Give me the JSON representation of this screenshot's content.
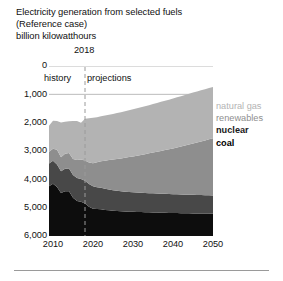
{
  "titles": {
    "line1": "Electricity generation from selected fuels",
    "line2": "(Reference case)",
    "line3": "billion kilowatthours"
  },
  "annotations": {
    "divider_year": "2018",
    "history": "history",
    "projections": "projections"
  },
  "legend": {
    "natural_gas": "natural gas",
    "renewables": "renewables",
    "nuclear": "nuclear",
    "coal": "coal"
  },
  "axes": {
    "y_ticks": [
      "6,000",
      "5,000",
      "4,000",
      "3,000",
      "2,000",
      "1,000",
      "0"
    ],
    "x_ticks": [
      "2010",
      "2020",
      "2030",
      "2040",
      "2050"
    ]
  },
  "colors": {
    "natural_gas": "#b3b3b3",
    "renewables": "#8e8e8e",
    "nuclear": "#484848",
    "coal": "#0d0d0d",
    "gridline": "#a8a8a8",
    "divider": "#9a9a9a",
    "background": "#ffffff"
  },
  "chart_data": {
    "type": "area",
    "stacked": true,
    "title": "Electricity generation from selected fuels (Reference case)",
    "subtitle": "billion kilowatthours",
    "xlabel": "",
    "ylabel": "billion kilowatthours",
    "ylim": [
      0,
      6000
    ],
    "xlim": [
      2009,
      2050
    ],
    "y_ticks": [
      0,
      1000,
      2000,
      3000,
      4000,
      5000,
      6000
    ],
    "x_ticks": [
      2010,
      2020,
      2030,
      2040,
      2050
    ],
    "grid": "horizontal-partial",
    "legend_position": "right",
    "divider_year": 2018,
    "divider_label_left": "history",
    "divider_label_right": "projections",
    "x": [
      2009,
      2010,
      2011,
      2012,
      2013,
      2014,
      2015,
      2016,
      2017,
      2018,
      2019,
      2020,
      2021,
      2022,
      2023,
      2024,
      2025,
      2026,
      2027,
      2028,
      2029,
      2030,
      2031,
      2032,
      2033,
      2034,
      2035,
      2036,
      2037,
      2038,
      2039,
      2040,
      2041,
      2042,
      2043,
      2044,
      2045,
      2046,
      2047,
      2048,
      2049,
      2050
    ],
    "series": [
      {
        "name": "coal",
        "color": "#0d0d0d",
        "values": [
          1756,
          1847,
          1733,
          1514,
          1581,
          1582,
          1352,
          1239,
          1206,
          1146,
          1030,
          966,
          950,
          942,
          920,
          905,
          890,
          880,
          872,
          866,
          860,
          855,
          850,
          845,
          840,
          836,
          832,
          828,
          824,
          820,
          816,
          812,
          808,
          805,
          802,
          800,
          798,
          796,
          794,
          792,
          790,
          788
        ]
      },
      {
        "name": "nuclear",
        "color": "#484848",
        "values": [
          799,
          807,
          790,
          769,
          789,
          797,
          797,
          806,
          805,
          807,
          805,
          790,
          775,
          760,
          745,
          735,
          725,
          715,
          705,
          700,
          695,
          690,
          685,
          680,
          678,
          676,
          674,
          672,
          670,
          668,
          666,
          664,
          662,
          660,
          658,
          656,
          654,
          652,
          650,
          648,
          646,
          644
        ]
      },
      {
        "name": "renewables",
        "color": "#8e8e8e",
        "values": [
          419,
          428,
          521,
          500,
          534,
          548,
          572,
          635,
          687,
          713,
          760,
          815,
          880,
          940,
          995,
          1040,
          1085,
          1125,
          1160,
          1195,
          1230,
          1265,
          1300,
          1335,
          1370,
          1405,
          1440,
          1475,
          1510,
          1545,
          1580,
          1615,
          1655,
          1695,
          1735,
          1775,
          1815,
          1855,
          1895,
          1935,
          1975,
          2015
        ]
      },
      {
        "name": "natural gas",
        "color": "#b3b3b3",
        "values": [
          921,
          988,
          1013,
          1225,
          1125,
          1126,
          1335,
          1378,
          1296,
          1468,
          1560,
          1600,
          1590,
          1585,
          1590,
          1600,
          1610,
          1620,
          1630,
          1640,
          1650,
          1660,
          1670,
          1680,
          1690,
          1700,
          1710,
          1720,
          1730,
          1740,
          1750,
          1760,
          1768,
          1775,
          1782,
          1788,
          1794,
          1798,
          1802,
          1806,
          1810,
          1815
        ]
      }
    ]
  }
}
